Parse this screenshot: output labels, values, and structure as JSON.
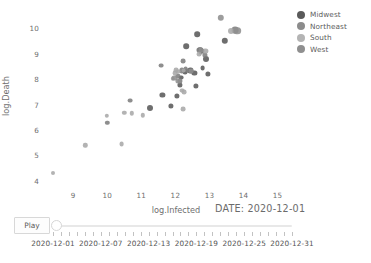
{
  "chart_data": {
    "type": "scatter",
    "title": "",
    "xlabel": "log.Infected",
    "ylabel": "log.Death",
    "xlim": [
      8.2,
      15.6
    ],
    "ylim": [
      3.75,
      10.65
    ],
    "xticks": [
      9,
      10,
      11,
      12,
      13,
      14,
      15
    ],
    "yticks": [
      4,
      5,
      6,
      7,
      8,
      9,
      10
    ],
    "grid": false,
    "legend_position": "top-right",
    "annotation": "DATE: 2020-12-01",
    "series": [
      {
        "name": "Midwest",
        "color": "#5a5a5a",
        "points": [
          {
            "x": 11.26,
            "y": 6.86,
            "r": 3.0
          },
          {
            "x": 11.62,
            "y": 7.38,
            "r": 2.6
          },
          {
            "x": 11.86,
            "y": 6.96,
            "r": 2.6
          },
          {
            "x": 12.05,
            "y": 7.33,
            "r": 2.6
          },
          {
            "x": 12.13,
            "y": 7.78,
            "r": 2.6
          },
          {
            "x": 12.17,
            "y": 8.06,
            "r": 2.4
          },
          {
            "x": 12.28,
            "y": 8.28,
            "r": 2.4
          },
          {
            "x": 12.31,
            "y": 9.31,
            "r": 2.8
          },
          {
            "x": 12.44,
            "y": 8.35,
            "r": 2.6
          },
          {
            "x": 12.56,
            "y": 8.24,
            "r": 2.6
          },
          {
            "x": 12.64,
            "y": 9.78,
            "r": 2.8
          },
          {
            "x": 12.72,
            "y": 9.17,
            "r": 2.8
          },
          {
            "x": 12.78,
            "y": 9.12,
            "r": 2.6
          },
          {
            "x": 12.8,
            "y": 8.44,
            "r": 2.4
          },
          {
            "x": 12.9,
            "y": 8.78,
            "r": 3.0
          },
          {
            "x": 12.95,
            "y": 8.22,
            "r": 2.6
          },
          {
            "x": 12.61,
            "y": 7.72,
            "r": 2.6
          },
          {
            "x": 13.45,
            "y": 9.52,
            "r": 3.2
          }
        ]
      },
      {
        "name": "Northeast",
        "color": "#7e7e7e",
        "points": [
          {
            "x": 10.0,
            "y": 6.28,
            "r": 2.2
          },
          {
            "x": 10.66,
            "y": 7.16,
            "r": 2.4
          },
          {
            "x": 11.58,
            "y": 8.54,
            "r": 2.4
          },
          {
            "x": 12.08,
            "y": 8.12,
            "r": 2.6
          },
          {
            "x": 12.14,
            "y": 7.92,
            "r": 2.6
          },
          {
            "x": 12.19,
            "y": 8.35,
            "r": 2.6
          },
          {
            "x": 12.22,
            "y": 8.72,
            "r": 2.4
          },
          {
            "x": 12.3,
            "y": 8.4,
            "r": 2.4
          },
          {
            "x": 12.35,
            "y": 8.34,
            "r": 2.4
          },
          {
            "x": 12.7,
            "y": 9.15,
            "r": 2.6
          },
          {
            "x": 12.74,
            "y": 9.05,
            "r": 2.4
          },
          {
            "x": 12.86,
            "y": 8.95,
            "r": 2.6
          },
          {
            "x": 13.75,
            "y": 9.93,
            "r": 3.4
          }
        ]
      },
      {
        "name": "South",
        "color": "#a8a8a8",
        "points": [
          {
            "x": 8.4,
            "y": 4.3,
            "r": 2.0
          },
          {
            "x": 9.35,
            "y": 5.4,
            "r": 2.2
          },
          {
            "x": 9.98,
            "y": 6.55,
            "r": 2.2
          },
          {
            "x": 10.42,
            "y": 5.45,
            "r": 2.4
          },
          {
            "x": 10.5,
            "y": 6.68,
            "r": 2.2
          },
          {
            "x": 10.72,
            "y": 6.66,
            "r": 2.2
          },
          {
            "x": 11.05,
            "y": 6.58,
            "r": 2.2
          },
          {
            "x": 11.92,
            "y": 8.02,
            "r": 2.2
          },
          {
            "x": 11.98,
            "y": 8.25,
            "r": 2.4
          },
          {
            "x": 12.02,
            "y": 8.37,
            "r": 2.4
          },
          {
            "x": 12.09,
            "y": 8.3,
            "r": 2.4
          },
          {
            "x": 12.24,
            "y": 8.34,
            "r": 2.4
          },
          {
            "x": 12.2,
            "y": 7.55,
            "r": 2.4
          },
          {
            "x": 12.26,
            "y": 7.48,
            "r": 2.4
          },
          {
            "x": 12.7,
            "y": 8.98,
            "r": 2.4
          },
          {
            "x": 12.88,
            "y": 9.1,
            "r": 2.6
          },
          {
            "x": 13.62,
            "y": 9.92,
            "r": 3.0
          },
          {
            "x": 12.22,
            "y": 6.83,
            "r": 2.4
          }
        ]
      },
      {
        "name": "West",
        "color": "#8f8f8f",
        "points": [
          {
            "x": 11.97,
            "y": 8.05,
            "r": 2.6
          },
          {
            "x": 12.09,
            "y": 7.92,
            "r": 2.6
          },
          {
            "x": 12.45,
            "y": 8.32,
            "r": 2.4
          },
          {
            "x": 12.76,
            "y": 9.14,
            "r": 2.6
          },
          {
            "x": 13.34,
            "y": 10.42,
            "r": 3.2
          },
          {
            "x": 13.82,
            "y": 9.92,
            "r": 3.8
          }
        ]
      }
    ]
  },
  "legend": {
    "items": [
      {
        "label": "Midwest",
        "color": "#5a5a5a"
      },
      {
        "label": "Northeast",
        "color": "#8c8c8c"
      },
      {
        "label": "South",
        "color": "#b4b4b4"
      },
      {
        "label": "West",
        "color": "#8f8f8f"
      }
    ]
  },
  "controls": {
    "play_label": "Play",
    "slider": {
      "value": "2020-12-01",
      "min": "2020-12-01",
      "max": "2020-12-31",
      "steps": 31,
      "handle_position_pct": 0,
      "tick_labels": [
        "2020-12-01",
        "2020-12-07",
        "2020-12-13",
        "2020-12-19",
        "2020-12-25",
        "2020-12-31"
      ]
    }
  }
}
